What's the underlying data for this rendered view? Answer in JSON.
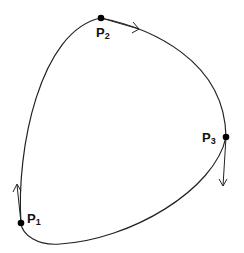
{
  "diagram": {
    "type": "closed-curve-with-tangents",
    "points": [
      {
        "id": "p1",
        "label": "P",
        "subscript": "1",
        "x": 21,
        "y": 223,
        "tangent": "up"
      },
      {
        "id": "p2",
        "label": "P",
        "subscript": "2",
        "x": 101,
        "y": 18,
        "tangent": "right"
      },
      {
        "id": "p3",
        "label": "P",
        "subscript": "3",
        "x": 226,
        "y": 137,
        "tangent": "down"
      }
    ],
    "colors": {
      "stroke": "#222222",
      "point": "#000000",
      "background": "#ffffff"
    }
  }
}
